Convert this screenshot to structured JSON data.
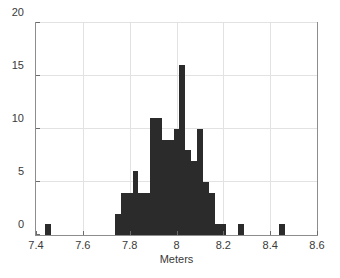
{
  "chart_data": {
    "type": "bar",
    "title": "",
    "subtitle": "",
    "xlabel": "Meters",
    "ylabel": "",
    "xlim": [
      7.4,
      8.6
    ],
    "ylim": [
      0,
      20
    ],
    "xticks": [
      7.4,
      7.6,
      7.8,
      8.0,
      8.2,
      8.4,
      8.6
    ],
    "xtick_labels": [
      "7.4",
      "7.6",
      "7.8",
      "8",
      "8.2",
      "8.4",
      "8.6"
    ],
    "yticks": [
      0,
      5,
      10,
      15,
      20
    ],
    "ytick_labels": [
      "0",
      "5",
      "10",
      "15",
      "20"
    ],
    "grid": true,
    "legend": "none",
    "bar_color": "#2b2b2b",
    "bin_width": 0.025,
    "categories": [
      "7.450",
      "7.750",
      "7.775",
      "7.800",
      "7.825",
      "7.850",
      "7.875",
      "7.900",
      "7.925",
      "7.950",
      "7.975",
      "8.000",
      "8.025",
      "8.050",
      "8.075",
      "8.100",
      "8.125",
      "8.150",
      "8.175",
      "8.200",
      "8.275",
      "8.450"
    ],
    "bin_centers": [
      7.45,
      7.75,
      7.775,
      7.8,
      7.825,
      7.85,
      7.875,
      7.9,
      7.925,
      7.95,
      7.975,
      8.0,
      8.025,
      8.05,
      8.075,
      8.1,
      8.125,
      8.15,
      8.175,
      8.2,
      8.275,
      8.45
    ],
    "values": [
      1,
      2,
      4,
      4,
      6,
      4,
      4,
      11,
      11,
      9,
      9,
      10,
      16,
      8,
      7,
      10,
      5,
      4,
      1,
      1,
      1,
      1
    ],
    "annotations": []
  },
  "axes": {
    "x_axis_name": "x-axis",
    "y_axis_name": "y-axis"
  }
}
